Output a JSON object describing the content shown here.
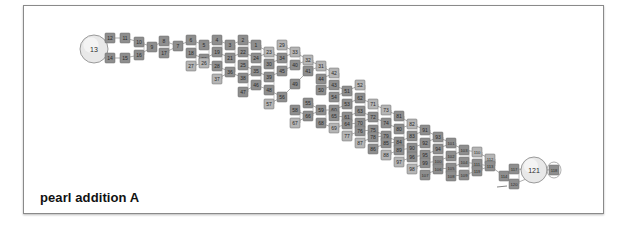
{
  "caption": "pearl addition A",
  "colors": {
    "frame": "#8a8a8a",
    "node_dark": "#8e8e8e",
    "node_light": "#b5b5b5",
    "node_border": "#6a6a6a",
    "node_text": "#2a2a2a",
    "edge": "#9a9a9a",
    "circle_fill": "#e8e8e8",
    "circle_stroke": "#9a9a9a"
  },
  "start_node": {
    "label": "13",
    "x": 94,
    "y": 49,
    "r": 14
  },
  "end_node": {
    "label": "121",
    "x": 534,
    "y": 170,
    "r": 13
  },
  "columns": [
    {
      "x": 110,
      "nodes": [
        {
          "l": "12",
          "y": 38,
          "d": 1
        },
        {
          "l": "14",
          "y": 58,
          "d": 1
        }
      ]
    },
    {
      "x": 125,
      "nodes": [
        {
          "l": "11",
          "y": 38,
          "d": 1
        },
        {
          "l": "15",
          "y": 58,
          "d": 1
        }
      ]
    },
    {
      "x": 139,
      "nodes": [
        {
          "l": "10",
          "y": 42,
          "d": 1
        },
        {
          "l": "16",
          "y": 55,
          "d": 1
        }
      ]
    },
    {
      "x": 152,
      "nodes": [
        {
          "l": "9",
          "y": 47,
          "d": 1
        }
      ]
    },
    {
      "x": 164,
      "nodes": [
        {
          "l": "8",
          "y": 41,
          "d": 1
        },
        {
          "l": "17",
          "y": 53,
          "d": 1
        }
      ]
    },
    {
      "x": 178,
      "nodes": [
        {
          "l": "7",
          "y": 46,
          "d": 1
        }
      ]
    },
    {
      "x": 191,
      "nodes": [
        {
          "l": "6",
          "y": 40,
          "d": 1
        },
        {
          "l": "18",
          "y": 53,
          "d": 1
        },
        {
          "l": "27",
          "y": 66,
          "d": 0
        }
      ]
    },
    {
      "x": 204,
      "nodes": [
        {
          "l": "5",
          "y": 45,
          "d": 1
        },
        {
          "l": "20",
          "y": 59,
          "d": 1
        },
        {
          "l": "26",
          "y": 63,
          "d": 0
        }
      ]
    },
    {
      "x": 217,
      "nodes": [
        {
          "l": "4",
          "y": 40,
          "d": 1
        },
        {
          "l": "19",
          "y": 52,
          "d": 1
        },
        {
          "l": "28",
          "y": 66,
          "d": 1
        },
        {
          "l": "37",
          "y": 79,
          "d": 0
        }
      ]
    },
    {
      "x": 230,
      "nodes": [
        {
          "l": "3",
          "y": 45,
          "d": 1
        },
        {
          "l": "21",
          "y": 58,
          "d": 1
        },
        {
          "l": "36",
          "y": 72,
          "d": 1
        }
      ]
    },
    {
      "x": 243,
      "nodes": [
        {
          "l": "2",
          "y": 40,
          "d": 1
        },
        {
          "l": "22",
          "y": 52,
          "d": 1
        },
        {
          "l": "25",
          "y": 65,
          "d": 1
        },
        {
          "l": "38",
          "y": 78,
          "d": 1
        },
        {
          "l": "47",
          "y": 92,
          "d": 1
        }
      ]
    },
    {
      "x": 256,
      "nodes": [
        {
          "l": "1",
          "y": 45,
          "d": 1
        },
        {
          "l": "24",
          "y": 58,
          "d": 1
        },
        {
          "l": "35",
          "y": 71,
          "d": 1
        },
        {
          "l": "46",
          "y": 85,
          "d": 1
        }
      ]
    },
    {
      "x": 269,
      "nodes": [
        {
          "l": "23",
          "y": 52,
          "d": 0
        },
        {
          "l": "30",
          "y": 64,
          "d": 1
        },
        {
          "l": "39",
          "y": 77,
          "d": 1
        },
        {
          "l": "48",
          "y": 90,
          "d": 1
        },
        {
          "l": "57",
          "y": 104,
          "d": 0
        }
      ]
    },
    {
      "x": 282,
      "nodes": [
        {
          "l": "29",
          "y": 45,
          "d": 0
        },
        {
          "l": "34",
          "y": 58,
          "d": 1
        },
        {
          "l": "45",
          "y": 71,
          "d": 1
        },
        {
          "l": "56",
          "y": 97,
          "d": 1
        }
      ]
    },
    {
      "x": 295,
      "nodes": [
        {
          "l": "33",
          "y": 52,
          "d": 0
        },
        {
          "l": "40",
          "y": 65,
          "d": 1
        },
        {
          "l": "49",
          "y": 84,
          "d": 1
        },
        {
          "l": "58",
          "y": 110,
          "d": 1
        },
        {
          "l": "67",
          "y": 123,
          "d": 0
        }
      ]
    },
    {
      "x": 308,
      "nodes": [
        {
          "l": "32",
          "y": 60,
          "d": 0
        },
        {
          "l": "41",
          "y": 71,
          "d": 1
        },
        {
          "l": "55",
          "y": 103,
          "d": 1
        },
        {
          "l": "66",
          "y": 116,
          "d": 1
        }
      ]
    },
    {
      "x": 321,
      "nodes": [
        {
          "l": "31",
          "y": 66,
          "d": 0
        },
        {
          "l": "44",
          "y": 79,
          "d": 1
        },
        {
          "l": "50",
          "y": 90,
          "d": 1
        },
        {
          "l": "59",
          "y": 110,
          "d": 1
        },
        {
          "l": "68",
          "y": 123,
          "d": 1
        }
      ]
    },
    {
      "x": 334,
      "nodes": [
        {
          "l": "42",
          "y": 73,
          "d": 0
        },
        {
          "l": "43",
          "y": 85,
          "d": 1
        },
        {
          "l": "54",
          "y": 97,
          "d": 1
        },
        {
          "l": "60",
          "y": 110,
          "d": 1
        },
        {
          "l": "65",
          "y": 116,
          "d": 1
        },
        {
          "l": "69",
          "y": 128,
          "d": 0
        }
      ]
    },
    {
      "x": 347,
      "nodes": [
        {
          "l": "51",
          "y": 91,
          "d": 1
        },
        {
          "l": "53",
          "y": 104,
          "d": 1
        },
        {
          "l": "61",
          "y": 117,
          "d": 1
        },
        {
          "l": "64",
          "y": 124,
          "d": 1
        },
        {
          "l": "77",
          "y": 136,
          "d": 0
        }
      ]
    },
    {
      "x": 360,
      "nodes": [
        {
          "l": "52",
          "y": 85,
          "d": 0
        },
        {
          "l": "62",
          "y": 98,
          "d": 1
        },
        {
          "l": "63",
          "y": 111,
          "d": 1
        },
        {
          "l": "70",
          "y": 123,
          "d": 1
        },
        {
          "l": "76",
          "y": 131,
          "d": 1
        },
        {
          "l": "87",
          "y": 143,
          "d": 0
        }
      ]
    },
    {
      "x": 373,
      "nodes": [
        {
          "l": "71",
          "y": 104,
          "d": 0
        },
        {
          "l": "72",
          "y": 117,
          "d": 1
        },
        {
          "l": "75",
          "y": 130,
          "d": 1
        },
        {
          "l": "78",
          "y": 137,
          "d": 1
        },
        {
          "l": "86",
          "y": 149,
          "d": 1
        }
      ]
    },
    {
      "x": 386,
      "nodes": [
        {
          "l": "73",
          "y": 110,
          "d": 0
        },
        {
          "l": "74",
          "y": 123,
          "d": 1
        },
        {
          "l": "79",
          "y": 136,
          "d": 1
        },
        {
          "l": "85",
          "y": 143,
          "d": 1
        },
        {
          "l": "88",
          "y": 155,
          "d": 0
        }
      ]
    },
    {
      "x": 399,
      "nodes": [
        {
          "l": "81",
          "y": 116,
          "d": 1
        },
        {
          "l": "80",
          "y": 129,
          "d": 1
        },
        {
          "l": "84",
          "y": 142,
          "d": 1
        },
        {
          "l": "89",
          "y": 150,
          "d": 1
        },
        {
          "l": "97",
          "y": 162,
          "d": 0
        }
      ]
    },
    {
      "x": 412,
      "nodes": [
        {
          "l": "82",
          "y": 124,
          "d": 0
        },
        {
          "l": "83",
          "y": 136,
          "d": 1
        },
        {
          "l": "90",
          "y": 148,
          "d": 1
        },
        {
          "l": "96",
          "y": 157,
          "d": 1
        },
        {
          "l": "98",
          "y": 169,
          "d": 0
        }
      ]
    },
    {
      "x": 425,
      "nodes": [
        {
          "l": "91",
          "y": 130,
          "d": 1
        },
        {
          "l": "92",
          "y": 143,
          "d": 1
        },
        {
          "l": "95",
          "y": 155,
          "d": 1
        },
        {
          "l": "99",
          "y": 163,
          "d": 1
        },
        {
          "l": "107",
          "y": 175,
          "d": 1
        }
      ]
    },
    {
      "x": 438,
      "nodes": [
        {
          "l": "93",
          "y": 137,
          "d": 1
        },
        {
          "l": "94",
          "y": 149,
          "d": 1
        },
        {
          "l": "100",
          "y": 161,
          "d": 1
        },
        {
          "l": "106",
          "y": 169,
          "d": 1
        }
      ]
    },
    {
      "x": 451,
      "nodes": [
        {
          "l": "101",
          "y": 143,
          "d": 1
        },
        {
          "l": "102",
          "y": 156,
          "d": 1
        },
        {
          "l": "105",
          "y": 168,
          "d": 1
        },
        {
          "l": "108",
          "y": 176,
          "d": 1
        }
      ]
    },
    {
      "x": 464,
      "nodes": [
        {
          "l": "103",
          "y": 150,
          "d": 1
        },
        {
          "l": "104",
          "y": 162,
          "d": 1
        },
        {
          "l": "109",
          "y": 175,
          "d": 1
        }
      ]
    },
    {
      "x": 477,
      "nodes": [
        {
          "l": "110",
          "y": 152,
          "d": 0
        },
        {
          "l": "111",
          "y": 164,
          "d": 1
        },
        {
          "l": "119",
          "y": 171,
          "d": 1
        }
      ]
    },
    {
      "x": 490,
      "nodes": [
        {
          "l": "112",
          "y": 159,
          "d": 0
        },
        {
          "l": "113",
          "y": 166,
          "d": 1
        }
      ]
    },
    {
      "x": 504,
      "nodes": [
        {
          "l": "114",
          "y": 176,
          "d": 1
        }
      ]
    },
    {
      "x": 514,
      "nodes": [
        {
          "l": "117",
          "y": 169,
          "d": 1
        },
        {
          "l": "120",
          "y": 184,
          "d": 1
        }
      ]
    },
    {
      "x": 554,
      "nodes": [
        {
          "l": "118",
          "y": 170,
          "d": 1
        }
      ]
    }
  ]
}
